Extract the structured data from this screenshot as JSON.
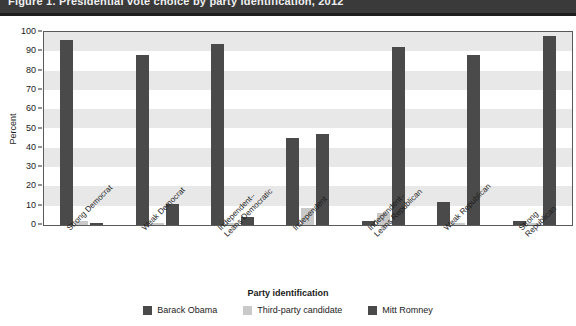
{
  "banner": {
    "title": "Figure 1.  Presidential vote choice by party identification, 2012"
  },
  "chart_data": {
    "type": "bar",
    "title": "Presidential vote choice by party identification",
    "xlabel": "Party identification",
    "ylabel": "Percent",
    "ylim": [
      0,
      100
    ],
    "ytick_step": 10,
    "yticks": [
      "100",
      "90",
      "80",
      "70",
      "60",
      "50",
      "40",
      "30",
      "20",
      "10",
      "0"
    ],
    "grid": "horizontal alternating bands",
    "legend_position": "bottom-center",
    "categories": [
      "Strong Democrat",
      "Weak Democrat",
      "Independent–\nLeans Democratic",
      "Independent",
      "Independent–\nLeans Republican",
      "Weak Republican",
      "Strong Republican"
    ],
    "series": [
      {
        "name": "Barack Obama",
        "color": "#4a4a4a",
        "values": [
          96,
          88,
          94,
          45,
          2,
          12,
          2
        ]
      },
      {
        "name": "Third-party candidate",
        "color": "#c9c9c9",
        "values": [
          2,
          1,
          1,
          9,
          6,
          1,
          1
        ]
      },
      {
        "name": "Mitt Romney",
        "color": "#4a4a4a",
        "values": [
          1,
          11,
          4,
          47,
          92,
          88,
          98
        ]
      }
    ]
  }
}
